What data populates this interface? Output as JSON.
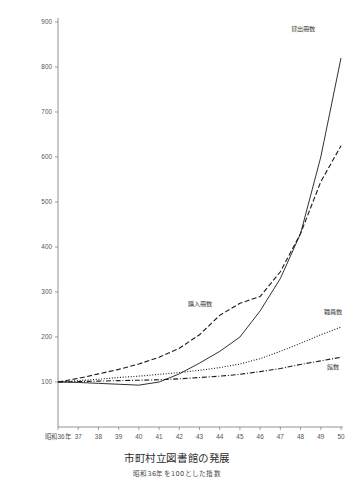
{
  "chart_data": {
    "type": "line",
    "title": "市町村立図書館の発展",
    "subtitle": "昭和36年を100とした指数",
    "xlabel": "",
    "ylabel": "",
    "grid": false,
    "legend_position": "inline-annotations",
    "ylim": [
      60,
      900
    ],
    "yticks": [
      100,
      200,
      300,
      400,
      500,
      600,
      700,
      800,
      900
    ],
    "categories": [
      "昭和36年",
      "37",
      "38",
      "39",
      "40",
      "41",
      "42",
      "43",
      "44",
      "45",
      "46",
      "47",
      "48",
      "49",
      "50"
    ],
    "x": [
      36,
      37,
      38,
      39,
      40,
      41,
      42,
      43,
      44,
      45,
      46,
      47,
      48,
      49,
      50
    ],
    "series": [
      {
        "name": "貸出冊数",
        "style": "solid",
        "label_x": 48.1,
        "label_y": 880,
        "values": [
          100,
          99,
          97,
          95,
          93,
          100,
          118,
          142,
          168,
          200,
          258,
          330,
          430,
          600,
          820
        ]
      },
      {
        "name": "購入冊数",
        "style": "dashed",
        "label_x": 43.0,
        "label_y": 268,
        "values": [
          100,
          108,
          118,
          128,
          140,
          155,
          175,
          205,
          248,
          275,
          290,
          345,
          430,
          545,
          625
        ]
      },
      {
        "name": "職員数",
        "style": "dotted",
        "label_x": 49.6,
        "label_y": 252,
        "values": [
          100,
          103,
          106,
          110,
          113,
          117,
          121,
          126,
          132,
          140,
          152,
          168,
          186,
          205,
          222
        ]
      },
      {
        "name": "館数",
        "style": "dashdot",
        "label_x": 49.6,
        "label_y": 130,
        "values": [
          100,
          101,
          102,
          103,
          104,
          105,
          107,
          110,
          113,
          117,
          123,
          130,
          139,
          147,
          155
        ]
      }
    ]
  }
}
